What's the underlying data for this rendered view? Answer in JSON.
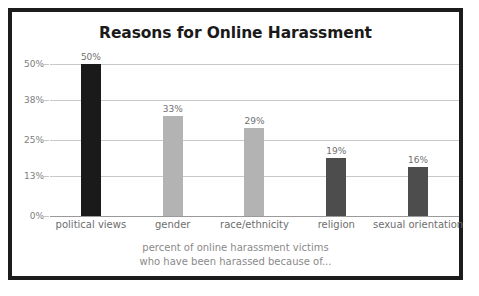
{
  "chart_data": {
    "type": "bar",
    "title": "Reasons for Online Harassment",
    "subtitle": "",
    "xlabel": "",
    "ylabel": "",
    "categories": [
      "political views",
      "gender",
      "race/ethnicity",
      "religion",
      "sexual orientation"
    ],
    "values": [
      50,
      33,
      29,
      19,
      16
    ],
    "value_labels": [
      "50%",
      "33%",
      "29%",
      "19%",
      "16%"
    ],
    "bar_colors": [
      "#1a1a1a",
      "#b3b3b3",
      "#b3b3b3",
      "#4d4d4d",
      "#4d4d4d"
    ],
    "ylim": [
      0,
      50
    ],
    "yticks": [
      0,
      13,
      25,
      38,
      50
    ],
    "ytick_labels": [
      "0%",
      "13%",
      "25%",
      "38%",
      "50%"
    ],
    "grid": true,
    "legend": false,
    "legend_position": "none",
    "caption_line1": "percent of online harassment victims",
    "caption_line2": "who have been harassed because of...",
    "colors": {
      "frame": "#1c1c1c",
      "background": "#ffffff",
      "gridline": "#c9c9c9",
      "axis": "#9a9a9a",
      "title_text": "#1a1a1a",
      "tick_text": "#7d7d7d",
      "category_text": "#6e6e6e",
      "value_text": "#6f6f6f",
      "caption_text": "#8a8a8a"
    }
  }
}
